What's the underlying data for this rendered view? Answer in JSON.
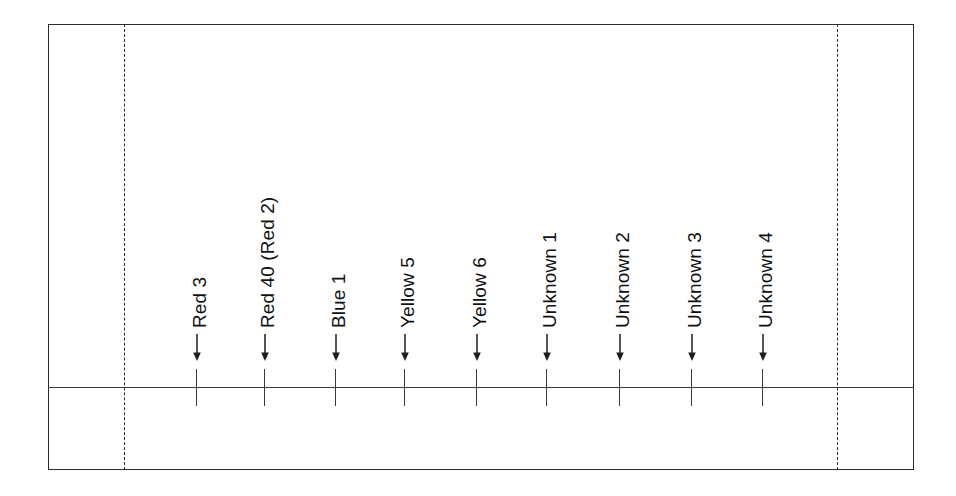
{
  "figure": {
    "kind": "tlc-plate-diagram",
    "width": 956,
    "height": 496,
    "background_color": "#ffffff",
    "line_color": "#2b2b2b"
  },
  "plate": {
    "border_style": "solid",
    "solvent_edge_style": "dashed",
    "baseline_label": "origin-baseline"
  },
  "lanes": [
    {
      "label": "Red 3",
      "x": 197,
      "marker": "down-arrow"
    },
    {
      "label": "Red 40 (Red 2)",
      "x": 265,
      "marker": "down-arrow"
    },
    {
      "label": "Blue 1",
      "x": 336,
      "marker": "down-arrow"
    },
    {
      "label": "Yellow 5",
      "x": 405,
      "marker": "down-arrow"
    },
    {
      "label": "Yellow 6",
      "x": 477,
      "marker": "down-arrow"
    },
    {
      "label": "Unknown 1",
      "x": 547,
      "marker": "down-arrow"
    },
    {
      "label": "Unknown 2",
      "x": 620,
      "marker": "down-arrow"
    },
    {
      "label": "Unknown 3",
      "x": 692,
      "marker": "down-arrow"
    },
    {
      "label": "Unknown 4",
      "x": 763,
      "marker": "down-arrow"
    }
  ],
  "chart_data": {
    "type": "table",
    "title": "",
    "xlabel": "",
    "ylabel": "",
    "categories": [
      "Red 3",
      "Red 40 (Red 2)",
      "Blue 1",
      "Yellow 5",
      "Yellow 6",
      "Unknown 1",
      "Unknown 2",
      "Unknown 3",
      "Unknown 4"
    ],
    "values": [
      0,
      0,
      0,
      0,
      0,
      0,
      0,
      0,
      0
    ]
  }
}
